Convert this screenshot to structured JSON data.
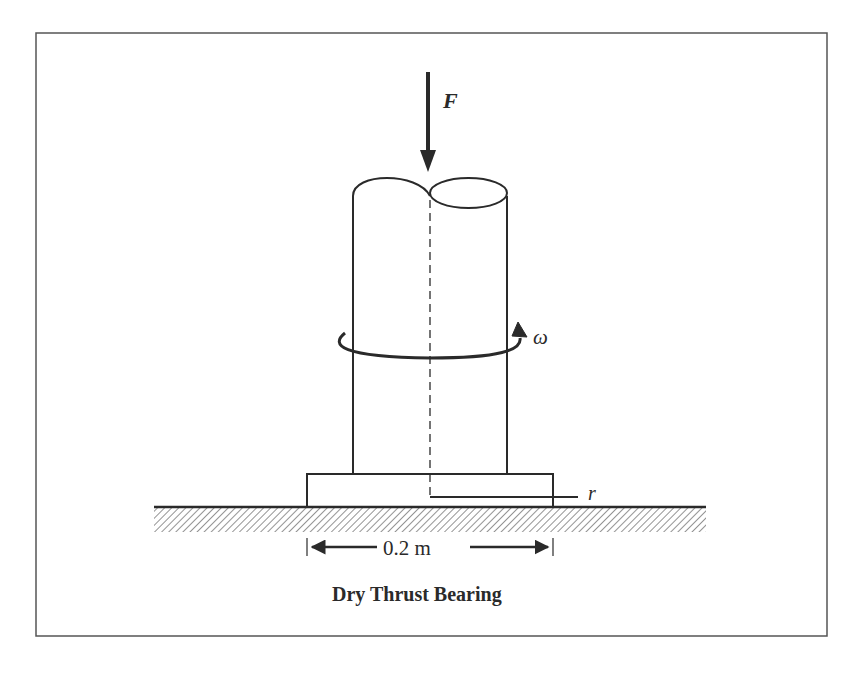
{
  "figure": {
    "caption": "Dry Thrust Bearing",
    "labels": {
      "force": "F",
      "angular_velocity": "ω",
      "radius": "r",
      "diameter_dimension": "0.2 m"
    },
    "colors": {
      "line": "#2a2a2a",
      "frame": "#555555",
      "hatch": "#666666",
      "background": "#ffffff"
    }
  }
}
